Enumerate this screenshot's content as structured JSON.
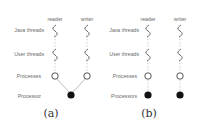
{
  "figure": {
    "panels": [
      {
        "id": "a",
        "caption": "(a)",
        "columns": [
          "reader",
          "writer"
        ],
        "rows": [
          "Java threads",
          "User threads",
          "Processes",
          "Processor"
        ],
        "processor_mode": "shared"
      },
      {
        "id": "b",
        "caption": "(b)",
        "columns": [
          "reader",
          "writer"
        ],
        "rows": [
          "Java threads",
          "User threads",
          "Processes",
          "Processors"
        ],
        "processor_mode": "dedicated"
      }
    ],
    "colors": {
      "label": "#6a6a6a",
      "thread": "#555555",
      "process_fill": "#ffffff",
      "processor_fill": "#111111",
      "connector": "#aaaaaa"
    }
  }
}
